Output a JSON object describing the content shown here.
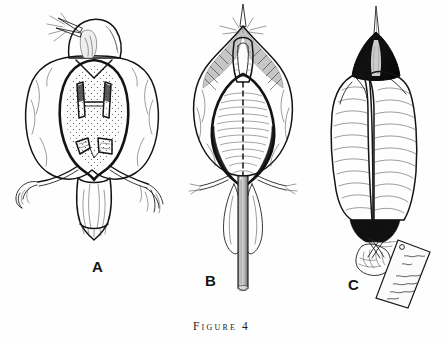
{
  "figure": {
    "caption": "Figure 4",
    "caption_number": "4",
    "background_color": "#fefefe",
    "ink_color": "#141414",
    "domain_subject": "bird specimen preparation plates",
    "panels": [
      {
        "id": "A",
        "label": "A",
        "title": "ventral view of skinned bird with opened body cavity",
        "elements": [
          "bird-head-dark-cap",
          "open-beak",
          "rictal-bristles",
          "opened-body-cavity",
          "sternum-structures",
          "viscera-fragments",
          "stippled-abdomen",
          "left-leg-with-foot",
          "right-leg-with-foot",
          "tail-feathers",
          "plumage-outline"
        ]
      },
      {
        "id": "B",
        "label": "B",
        "title": "bird on its back pinned along midline with dashed incision line",
        "elements": [
          "beak-pointing-up",
          "rictal-bristles",
          "hatched-throat-shading",
          "open-breast-incision",
          "dashed-midline",
          "hatched-breast-muscle",
          "dark-cavity-margin",
          "wing-feathers",
          "both-legs",
          "vertical-pin-rod",
          "pin-rod-tip"
        ]
      },
      {
        "id": "C",
        "label": "C",
        "title": "finished study skin wrapped in a paper cone with specimen tag",
        "elements": [
          "black-head-with-long-beak",
          "paper-cone-wrapping",
          "cone-crease-lines",
          "dark-tail-tip",
          "crossed-legs-tied-together",
          "thread-tie",
          "specimen-tag",
          "tag-handwriting-lines"
        ]
      }
    ]
  },
  "labels": {
    "a": "A",
    "b": "B",
    "c": "C"
  },
  "tag": {
    "handwriting_lines": [
      "",
      "",
      "",
      ""
    ]
  }
}
